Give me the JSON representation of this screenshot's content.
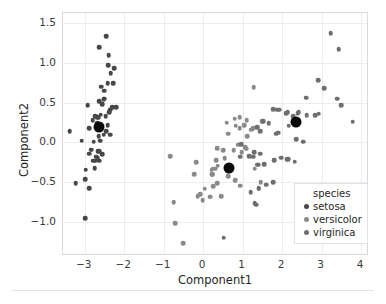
{
  "chart_data": {
    "type": "scatter",
    "title": "",
    "xlabel": "Component1",
    "ylabel": "Component2",
    "xlim": [
      -3.55,
      4.2
    ],
    "ylim": [
      -1.42,
      1.62
    ],
    "xticks": [
      -3,
      -2,
      -1,
      0,
      1,
      2,
      3,
      4
    ],
    "xtick_labels": [
      "−3",
      "−2",
      "−1",
      "0",
      "1",
      "2",
      "3",
      "4"
    ],
    "yticks": [
      -1.0,
      -0.5,
      0.0,
      0.5,
      1.0,
      1.5
    ],
    "ytick_labels": [
      "−1.0",
      "−0.5",
      "0.0",
      "0.5",
      "1.0",
      "1.5"
    ],
    "grid": true,
    "legend_position": "lower right",
    "legend_title": "species",
    "colors": {
      "setosa": "#474747",
      "versicolor": "#8a8a8a",
      "virginica": "#6e6e6e",
      "centroid": "#090909",
      "grid": "#ececf1",
      "frame": "#d9d9dd",
      "text": "#262626"
    },
    "series": [
      {
        "name": "setosa",
        "color": "#474747",
        "points": [
          [
            -2.68,
            0.32
          ],
          [
            -2.71,
            -0.18
          ],
          [
            -2.89,
            -0.14
          ],
          [
            -2.75,
            -0.32
          ],
          [
            -2.73,
            0.33
          ],
          [
            -2.28,
            0.74
          ],
          [
            -2.82,
            -0.09
          ],
          [
            -2.63,
            0.16
          ],
          [
            -2.88,
            -0.57
          ],
          [
            -2.67,
            -0.11
          ],
          [
            -2.51,
            0.65
          ],
          [
            -2.61,
            0.02
          ],
          [
            -2.79,
            -0.23
          ],
          [
            -3.23,
            -0.51
          ],
          [
            -2.64,
            1.19
          ],
          [
            -2.39,
            1.09
          ],
          [
            -2.92,
            0.47
          ],
          [
            -2.68,
            0.24
          ],
          [
            -2.25,
            0.93
          ],
          [
            -2.5,
            0.55
          ],
          [
            -2.36,
            0.41
          ],
          [
            -2.47,
            0.33
          ],
          [
            -3.08,
            0.02
          ],
          [
            -2.35,
            0.1
          ],
          [
            -2.52,
            0.1
          ],
          [
            -2.56,
            -0.15
          ],
          [
            -2.45,
            0.14
          ],
          [
            -2.6,
            0.35
          ],
          [
            -2.65,
            0.31
          ],
          [
            -2.67,
            -0.2
          ],
          [
            -2.64,
            -0.23
          ],
          [
            -2.38,
            0.38
          ],
          [
            -2.58,
            0.7
          ],
          [
            -2.41,
            0.97
          ],
          [
            -2.63,
            -0.11
          ],
          [
            -2.77,
            0.01
          ],
          [
            -2.63,
            0.52
          ],
          [
            -2.89,
            0.18
          ],
          [
            -2.99,
            -0.46
          ],
          [
            -2.6,
            0.23
          ],
          [
            -2.8,
            0.28
          ],
          [
            -2.99,
            -0.95
          ],
          [
            -2.98,
            -0.34
          ],
          [
            -2.42,
            0.22
          ],
          [
            -2.21,
            0.44
          ],
          [
            -2.73,
            -0.23
          ],
          [
            -2.52,
            0.54
          ],
          [
            -2.85,
            -0.09
          ],
          [
            -2.55,
            0.48
          ],
          [
            -2.65,
            0.08
          ],
          [
            -2.46,
            1.33
          ],
          [
            -3.38,
            0.14
          ],
          [
            -2.34,
            0.87
          ],
          [
            -2.42,
            0.74
          ],
          [
            -2.3,
            0.44
          ]
        ]
      },
      {
        "name": "versicolor",
        "color": "#8a8a8a",
        "points": [
          [
            1.28,
            0.69
          ],
          [
            0.93,
            0.32
          ],
          [
            1.46,
            -0.5
          ],
          [
            0.18,
            -0.68
          ],
          [
            1.09,
            -0.08
          ],
          [
            0.64,
            -0.42
          ],
          [
            1.1,
            0.28
          ],
          [
            -0.75,
            -0.75
          ],
          [
            1.04,
            0.22
          ],
          [
            -0.01,
            -0.72
          ],
          [
            -0.51,
            -1.26
          ],
          [
            0.51,
            -0.1
          ],
          [
            0.26,
            -0.55
          ],
          [
            0.98,
            -0.12
          ],
          [
            -0.17,
            -0.25
          ],
          [
            0.93,
            0.18
          ],
          [
            0.66,
            -0.35
          ],
          [
            0.23,
            -0.4
          ],
          [
            0.94,
            -0.54
          ],
          [
            0.04,
            -0.58
          ],
          [
            1.12,
            0.08
          ],
          [
            0.36,
            -0.07
          ],
          [
            1.3,
            -0.33
          ],
          [
            1.06,
            -0.06
          ],
          [
            0.64,
            0.11
          ],
          [
            0.82,
            0.21
          ],
          [
            1.26,
            0.18
          ],
          [
            1.5,
            0.27
          ],
          [
            0.77,
            -0.1
          ],
          [
            -0.23,
            -0.4
          ],
          [
            -0.08,
            -0.65
          ],
          [
            -0.14,
            -0.67
          ],
          [
            0.22,
            -0.34
          ],
          [
            1.37,
            -0.28
          ],
          [
            0.6,
            0.25
          ],
          [
            0.8,
            0.3
          ],
          [
            1.22,
            0.16
          ],
          [
            0.81,
            -0.47
          ],
          [
            0.24,
            -0.33
          ],
          [
            0.17,
            -0.68
          ],
          [
            0.46,
            -0.67
          ],
          [
            0.89,
            -0.03
          ],
          [
            0.23,
            -0.4
          ],
          [
            -0.71,
            -1.01
          ],
          [
            0.36,
            -0.51
          ],
          [
            0.33,
            -0.22
          ],
          [
            0.37,
            -0.29
          ],
          [
            0.55,
            -0.2
          ],
          [
            -0.83,
            -0.17
          ],
          [
            0.3,
            -0.33
          ]
        ]
      },
      {
        "name": "virginica",
        "color": "#6e6e6e",
        "points": [
          [
            2.53,
            0.01
          ],
          [
            1.41,
            -0.58
          ],
          [
            2.62,
            0.34
          ],
          [
            1.97,
            -0.19
          ],
          [
            2.35,
            0.04
          ],
          [
            3.4,
            0.55
          ],
          [
            0.52,
            -1.19
          ],
          [
            2.93,
            0.36
          ],
          [
            2.32,
            -0.24
          ],
          [
            2.92,
            0.78
          ],
          [
            1.66,
            0.24
          ],
          [
            1.8,
            -0.22
          ],
          [
            2.17,
            0.21
          ],
          [
            1.34,
            -0.78
          ],
          [
            1.59,
            -0.53
          ],
          [
            1.88,
            0.41
          ],
          [
            1.85,
            0.11
          ],
          [
            3.43,
            1.17
          ],
          [
            3.79,
            0.26
          ],
          [
            1.3,
            -0.76
          ],
          [
            2.42,
            0.38
          ],
          [
            1.2,
            -0.62
          ],
          [
            3.5,
            0.47
          ],
          [
            1.39,
            -0.28
          ],
          [
            2.28,
            0.33
          ],
          [
            2.61,
            0.56
          ],
          [
            1.26,
            -0.18
          ],
          [
            1.29,
            -0.12
          ],
          [
            2.12,
            -0.21
          ],
          [
            2.39,
            0.37
          ],
          [
            2.84,
            0.34
          ],
          [
            3.23,
            1.37
          ],
          [
            2.16,
            -0.21
          ],
          [
            1.44,
            -0.14
          ],
          [
            1.78,
            -0.5
          ],
          [
            3.07,
            0.68
          ],
          [
            2.14,
            0.38
          ],
          [
            1.44,
            0.14
          ],
          [
            1.77,
            0.42
          ],
          [
            1.9,
            0.12
          ],
          [
            1.16,
            -0.17
          ],
          [
            2.1,
            0.37
          ],
          [
            2.31,
            0.24
          ],
          [
            1.92,
            0.41
          ],
          [
            1.41,
            -0.57
          ],
          [
            1.55,
            -0.27
          ],
          [
            1.52,
            0.27
          ],
          [
            1.37,
            0.19
          ],
          [
            0.96,
            -0.02
          ],
          [
            0.94,
            -0.18
          ]
        ]
      }
    ],
    "centroids": [
      {
        "label": "setosa-centroid",
        "x": -2.64,
        "y": 0.19
      },
      {
        "label": "versicolor-centroid",
        "x": 0.66,
        "y": -0.32
      },
      {
        "label": "virginica-centroid",
        "x": 2.35,
        "y": 0.26
      }
    ],
    "legend_entries": [
      {
        "label": "setosa",
        "color": "#474747"
      },
      {
        "label": "versicolor",
        "color": "#8a8a8a"
      },
      {
        "label": "virginica",
        "color": "#6e6e6e"
      }
    ]
  }
}
